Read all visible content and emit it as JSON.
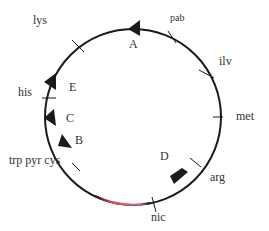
{
  "diagram": {
    "circle": {
      "cx": 133,
      "cy": 117,
      "r": 88,
      "color": "#1a1a1a"
    },
    "gene_markers": [
      {
        "label": "lys",
        "x": 33,
        "y": 14
      },
      {
        "label": "pab",
        "x": 170,
        "y": 12
      },
      {
        "label": "ilv",
        "x": 219,
        "y": 55
      },
      {
        "label": "met",
        "x": 236,
        "y": 107
      },
      {
        "label": "arg",
        "x": 210,
        "y": 171
      },
      {
        "label": "nic",
        "x": 151,
        "y": 208
      },
      {
        "label": "his",
        "x": 4,
        "y": 85
      },
      {
        "label": "trp pyr cys",
        "x": 8,
        "y": 158
      }
    ],
    "segments": [
      {
        "label": "A",
        "x": 129,
        "y": 40
      },
      {
        "label": "E",
        "x": 69,
        "y": 81
      },
      {
        "label": "C",
        "x": 66,
        "y": 117
      },
      {
        "label": "B",
        "x": 75,
        "y": 138
      },
      {
        "label": "D",
        "x": 160,
        "y": 150
      }
    ],
    "highlight_color": "#e04a5a",
    "highlight_color2": "#4a5ae0"
  }
}
